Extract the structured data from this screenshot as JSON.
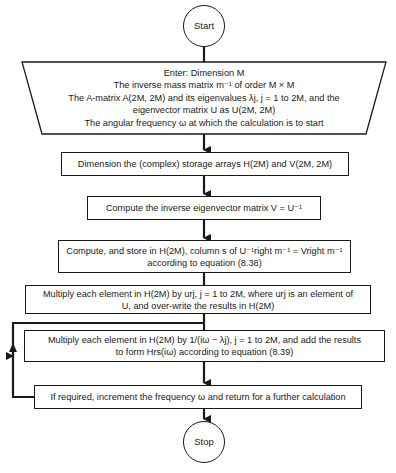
{
  "diagram": {
    "type": "flowchart",
    "start": {
      "label": "Start"
    },
    "input": {
      "lines": [
        "Enter: Dimension M",
        "The inverse mass matrix m⁻¹ of order M × M",
        "The A-matrix A(2M, 2M) and its eigenvalues λj, j = 1 to 2M, and the",
        "eigenvector matrix U as U(2M, 2M)",
        "The angular frequency ω at which the calculation is to start"
      ]
    },
    "steps": [
      {
        "id": "dimension",
        "lines": [
          "Dimension the (complex) storage arrays H(2M) and V(2M, 2M)"
        ]
      },
      {
        "id": "inverse",
        "lines": [
          "Compute the inverse eigenvector matrix V = U⁻¹"
        ]
      },
      {
        "id": "compute-store",
        "lines": [
          "Compute, and store in H(2M), column s of U⁻¹right m⁻¹ = Vright m⁻¹",
          "according to equation (8.38)"
        ]
      },
      {
        "id": "multiply-u",
        "lines": [
          "Multiply each element in H(2M) by urj, j = 1 to 2M, where urj is an element of",
          "U, and over-write the results in H(2M)"
        ]
      },
      {
        "id": "multiply-lambda",
        "lines": [
          "Multiply each element in H(2M) by 1/(iω − λj), j = 1 to 2M, and add the results",
          "to form Hrs(iω) according to equation (8.39)"
        ]
      },
      {
        "id": "increment",
        "lines": [
          "If required, increment the frequency ω and return for a further calculation"
        ]
      }
    ],
    "stop": {
      "label": "Stop"
    },
    "loop": {
      "from": "increment",
      "to": "multiply-lambda"
    }
  }
}
